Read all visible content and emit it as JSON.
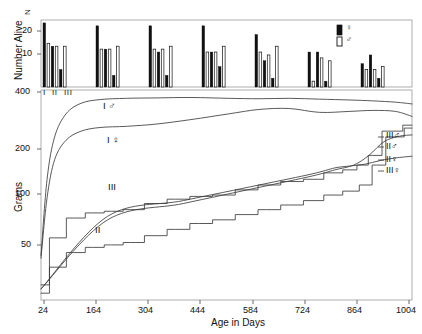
{
  "figure": {
    "background": "#ffffff",
    "line_color": "#3c3c3c",
    "bar_fill_female": "#111111",
    "bar_fill_male": "#ffffff",
    "bar_stroke": "#111111"
  },
  "top_panel": {
    "y_axis_title": "Number Alive",
    "y_ticks": [
      "20",
      "10"
    ],
    "y_tick_values": [
      20,
      10
    ],
    "n_marker": "N",
    "group_labels": [
      "I",
      "II",
      "III"
    ],
    "legend": {
      "female_symbol": "♀",
      "male_symbol": "♂",
      "female_swatch": "filled-bar",
      "male_swatch": "open-bar"
    }
  },
  "bottom_panel": {
    "y_axis_title": "Grams",
    "y_ticks": [
      "400",
      "200",
      "100",
      "50"
    ],
    "y_tick_values": [
      400,
      200,
      100,
      50
    ],
    "x_axis_title": "Age in Days",
    "x_ticks": [
      "24",
      "164",
      "304",
      "444",
      "584",
      "724",
      "864",
      "1004"
    ],
    "x_tick_values": [
      24,
      164,
      304,
      444,
      584,
      724,
      864,
      1004
    ],
    "inline_labels": [
      {
        "text": "I ♂",
        "x": 0.2,
        "y": 395
      },
      {
        "text": "I ♀",
        "x": 0.21,
        "y": 262
      },
      {
        "text": "III",
        "x": 0.26,
        "y": 118
      },
      {
        "text": "II",
        "x": 0.21,
        "y": 78
      }
    ],
    "right_labels": [
      "III♂",
      "II♂",
      "II♀",
      "III♀"
    ]
  },
  "chart_data": {
    "type": "line",
    "title": "",
    "xlabel": "Age in Days",
    "ylabel": "Grams",
    "ylim": [
      35,
      440
    ],
    "yscale": "log",
    "xlim": [
      24,
      1004
    ],
    "grid": false,
    "legend": "inline-right",
    "panels": [
      {
        "name": "survivorship",
        "type": "bar",
        "ylabel": "Number Alive",
        "ylim": [
          0,
          23
        ],
        "categories": [
          "24",
          "164",
          "304",
          "444",
          "584",
          "724",
          "864"
        ],
        "series": [
          {
            "name": "I ♀",
            "values": [
              22,
              21,
              21,
              21,
              18,
              12,
              8
            ]
          },
          {
            "name": "I ♂",
            "values": [
              15,
              13,
              13,
              12,
              12,
              2,
              6
            ]
          },
          {
            "name": "II ♀",
            "values": [
              14,
              13,
              12,
              12,
              9,
              12,
              11
            ]
          },
          {
            "name": "II ♂",
            "values": [
              14,
              13,
              13,
              12,
              11,
              10,
              6
            ]
          },
          {
            "name": "III ♀",
            "values": [
              6,
              4,
              4,
              7,
              3,
              2,
              3
            ]
          },
          {
            "name": "III ♂",
            "values": [
              14,
              14,
              14,
              14,
              14,
              9,
              7
            ]
          }
        ]
      },
      {
        "name": "growth",
        "type": "line",
        "ylabel": "Grams",
        "ylim": [
          35,
          440
        ],
        "yscale": "log",
        "series": [
          {
            "name": "I ♂",
            "x": [
              24,
              40,
              60,
              90,
              130,
              180,
              250,
              330,
              420,
              520,
              600,
              680,
              760,
              840,
              900,
              960,
              1004
            ],
            "y": [
              60,
              150,
              250,
              330,
              375,
              392,
              398,
              400,
              402,
              398,
              396,
              398,
              394,
              390,
              386,
              380,
              372
            ]
          },
          {
            "name": "I ♀",
            "x": [
              24,
              40,
              60,
              90,
              130,
              180,
              250,
              330,
              420,
              520,
              600,
              680,
              760,
              840,
              900,
              960,
              1004
            ],
            "y": [
              58,
              120,
              190,
              240,
              268,
              280,
              284,
              292,
              308,
              330,
              348,
              352,
              336,
              340,
              344,
              340,
              320
            ]
          },
          {
            "name": "III",
            "x": [
              24,
              60,
              110,
              160,
              210,
              260,
              320,
              380,
              440,
              500,
              560,
              620,
              680,
              740,
              790,
              840,
              870,
              900,
              940,
              1004
            ],
            "y": [
              42,
              74,
              94,
              100,
              102,
              104,
              112,
              118,
              122,
              124,
              132,
              140,
              146,
              150,
              162,
              168,
              178,
              200,
              268,
              288
            ]
          },
          {
            "name": "II",
            "x": [
              24,
              60,
              110,
              160,
              210,
              260,
              320,
              380,
              440,
              500,
              560,
              620,
              680,
              740,
              790,
              840,
              880,
              910,
              950,
              1004
            ],
            "y": [
              38,
              52,
              62,
              66,
              68,
              70,
              76,
              82,
              88,
              92,
              98,
              104,
              110,
              116,
              124,
              130,
              140,
              178,
              250,
              278
            ]
          },
          {
            "name": "III♀",
            "x": [
              24,
              200,
              400,
              600,
              740,
              800,
              840,
              880,
              920,
              960,
              1004
            ],
            "y": [
              40,
              96,
              116,
              140,
              160,
              172,
              176,
              180,
              188,
              194,
              198
            ]
          },
          {
            "name": "II♀",
            "x": [
              24,
              200,
              400,
              600,
              740,
              800,
              850,
              890,
              930,
              970,
              1004
            ],
            "y": [
              40,
              92,
              112,
              136,
              156,
              168,
              178,
              200,
              236,
              252,
              256
            ]
          }
        ]
      }
    ]
  }
}
